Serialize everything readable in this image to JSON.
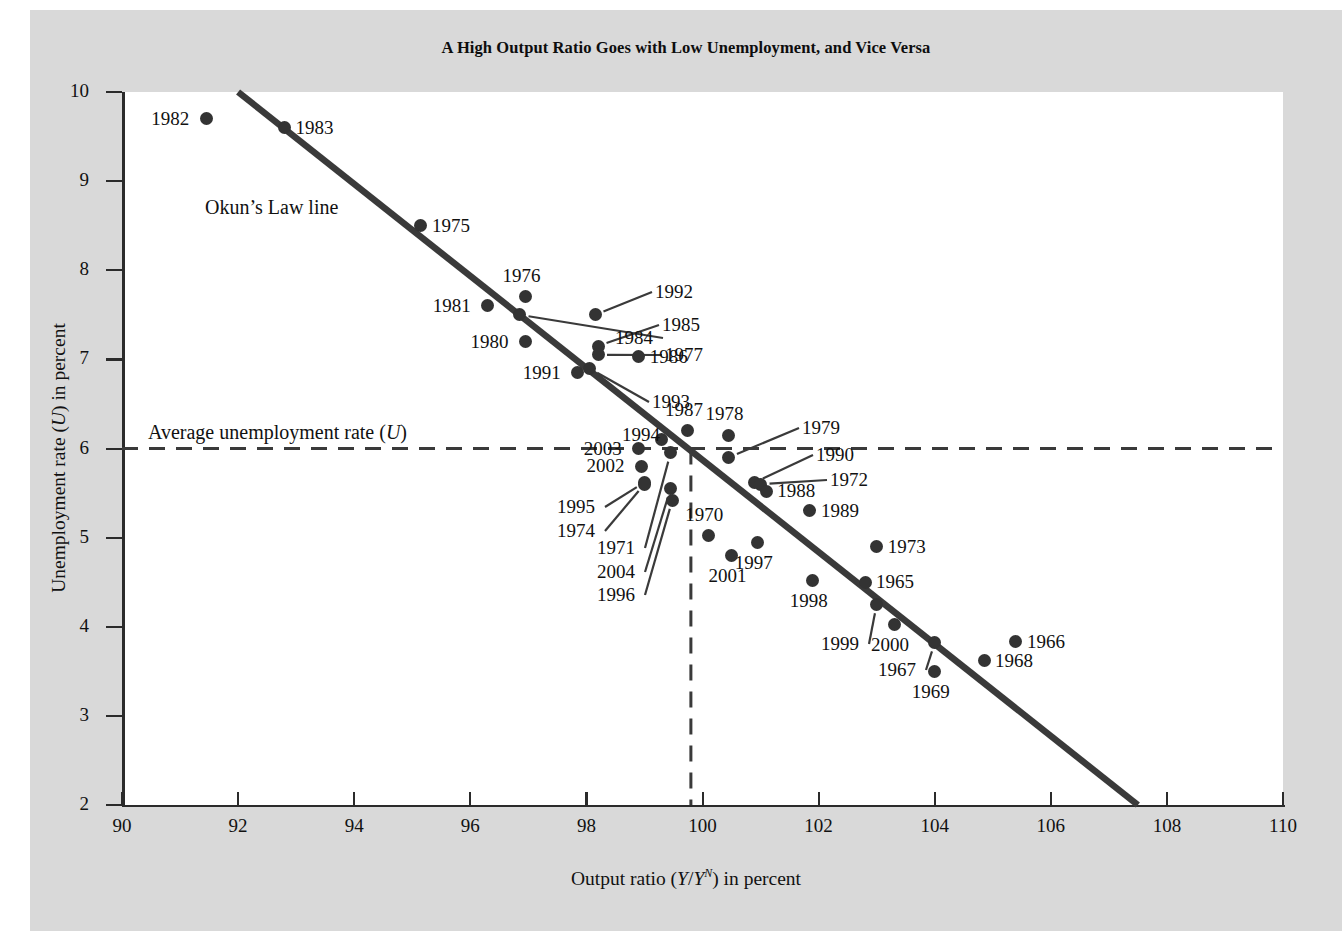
{
  "figure": {
    "title": "A High Output Ratio Goes with Low Unemployment, and Vice Versa",
    "background_color": "#d9d9d9",
    "plot_background_color": "#ffffff",
    "marker_color": "#333333",
    "line_color": "#3a3a3a"
  },
  "annotations": {
    "okun_line_label": "Okun’s Law line",
    "average_rate_label_pre": "Average unemployment rate (",
    "average_rate_label_var": "U",
    "average_rate_label_post": ")"
  },
  "axes": {
    "x": {
      "title_pre": "Output ratio (",
      "title_var1": "Y",
      "title_slash": "/",
      "title_var2": "Y",
      "title_sup": "N",
      "title_post": ") in percent",
      "min": 90,
      "max": 110,
      "ticks": [
        90,
        92,
        94,
        96,
        98,
        100,
        102,
        104,
        106,
        108,
        110
      ],
      "tick_labels": [
        "90",
        "92",
        "94",
        "96",
        "98",
        "100",
        "102",
        "104",
        "106",
        "108",
        "110"
      ]
    },
    "y": {
      "title_pre": "Unemployment rate (",
      "title_var": "U",
      "title_post": ") in percent",
      "min": 2,
      "max": 10,
      "ticks": [
        2,
        3,
        4,
        5,
        6,
        7,
        8,
        9,
        10
      ],
      "tick_labels": [
        "2",
        "3",
        "4",
        "5",
        "6",
        "7",
        "8",
        "9",
        "10"
      ]
    }
  },
  "chart_data": {
    "type": "scatter",
    "title": "A High Output Ratio Goes with Low Unemployment, and Vice Versa",
    "xlabel": "Output ratio (Y/Y^N) in percent",
    "ylabel": "Unemployment rate (U) in percent",
    "xlim": [
      90,
      110
    ],
    "ylim": [
      2,
      10
    ],
    "grid": false,
    "legend": "none",
    "point_label_field": "year",
    "points": [
      {
        "year": "1982",
        "x": 91.45,
        "y": 9.7,
        "label_side": "left"
      },
      {
        "year": "1983",
        "x": 92.8,
        "y": 9.6,
        "label_side": "right"
      },
      {
        "year": "1975",
        "x": 95.15,
        "y": 8.5,
        "label_side": "right"
      },
      {
        "year": "1976",
        "x": 96.95,
        "y": 7.7,
        "label_side": "above"
      },
      {
        "year": "1981",
        "x": 96.3,
        "y": 7.6,
        "label_side": "left"
      },
      {
        "year": "1984",
        "x": 96.85,
        "y": 7.5,
        "label_side": "leader-left"
      },
      {
        "year": "1980",
        "x": 96.95,
        "y": 7.2,
        "label_side": "left"
      },
      {
        "year": "1992",
        "x": 98.15,
        "y": 7.5,
        "label_side": "leader-right"
      },
      {
        "year": "1985",
        "x": 98.2,
        "y": 7.15,
        "label_side": "leader-right"
      },
      {
        "year": "1977",
        "x": 98.2,
        "y": 7.05,
        "label_side": "leader-right"
      },
      {
        "year": "1986",
        "x": 98.9,
        "y": 7.03,
        "label_side": "right"
      },
      {
        "year": "1991",
        "x": 97.85,
        "y": 6.85,
        "label_side": "left"
      },
      {
        "year": "1993",
        "x": 98.05,
        "y": 6.9,
        "label_side": "leader-right"
      },
      {
        "year": "1987",
        "x": 99.75,
        "y": 6.2,
        "label_side": "above"
      },
      {
        "year": "1994",
        "x": 99.3,
        "y": 6.1,
        "label_side": "leader-left"
      },
      {
        "year": "2003",
        "x": 98.9,
        "y": 6.0,
        "label_side": "left"
      },
      {
        "year": "1978",
        "x": 100.45,
        "y": 6.15,
        "label_side": "above"
      },
      {
        "year": "1979",
        "x": 100.45,
        "y": 5.9,
        "label_side": "leader-right"
      },
      {
        "year": "2002",
        "x": 98.95,
        "y": 5.8,
        "label_side": "left"
      },
      {
        "year": "1971",
        "x": 99.45,
        "y": 5.95,
        "label_side": "leader-left"
      },
      {
        "year": "1990",
        "x": 100.9,
        "y": 5.62,
        "label_side": "leader-right"
      },
      {
        "year": "1972",
        "x": 101.0,
        "y": 5.6,
        "label_side": "leader-right"
      },
      {
        "year": "1988",
        "x": 101.1,
        "y": 5.52,
        "label_side": "right"
      },
      {
        "year": "1995",
        "x": 99.0,
        "y": 5.62,
        "label_side": "leader-left"
      },
      {
        "year": "1974",
        "x": 99.0,
        "y": 5.6,
        "label_side": "leader-left"
      },
      {
        "year": "2004",
        "x": 99.45,
        "y": 5.55,
        "label_side": "leader-left"
      },
      {
        "year": "1996",
        "x": 99.48,
        "y": 5.42,
        "label_side": "leader-left"
      },
      {
        "year": "1989",
        "x": 101.85,
        "y": 5.3,
        "label_side": "right"
      },
      {
        "year": "1970",
        "x": 100.1,
        "y": 5.02,
        "label_side": "above"
      },
      {
        "year": "1997",
        "x": 100.95,
        "y": 4.95,
        "label_side": "below"
      },
      {
        "year": "2001",
        "x": 100.5,
        "y": 4.8,
        "label_side": "below"
      },
      {
        "year": "1973",
        "x": 103.0,
        "y": 4.9,
        "label_side": "right"
      },
      {
        "year": "1965",
        "x": 102.8,
        "y": 4.5,
        "label_side": "right"
      },
      {
        "year": "1998",
        "x": 101.9,
        "y": 4.52,
        "label_side": "below"
      },
      {
        "year": "1999",
        "x": 103.0,
        "y": 4.25,
        "label_side": "leader-left"
      },
      {
        "year": "2000",
        "x": 103.3,
        "y": 4.03,
        "label_side": "below"
      },
      {
        "year": "1967",
        "x": 104.0,
        "y": 3.82,
        "label_side": "leader-left"
      },
      {
        "year": "1969",
        "x": 104.0,
        "y": 3.5,
        "label_side": "below"
      },
      {
        "year": "1968",
        "x": 104.85,
        "y": 3.62,
        "label_side": "right"
      },
      {
        "year": "1966",
        "x": 105.4,
        "y": 3.83,
        "label_side": "right"
      }
    ],
    "okun_law_line": {
      "x1": 92.0,
      "y1": 10.0,
      "x2": 107.5,
      "y2": 2.0
    },
    "average_unemployment_rate": 6.0,
    "reference_output_ratio": 99.8
  }
}
